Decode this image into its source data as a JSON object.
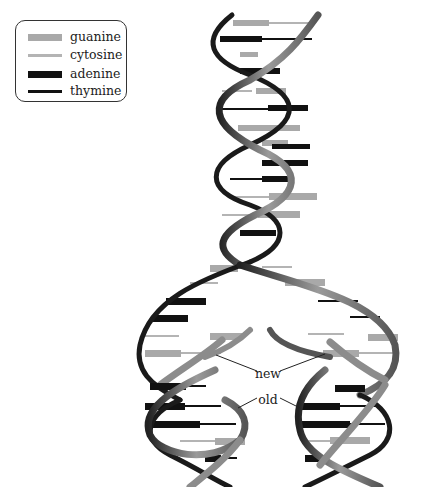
{
  "legend": {
    "items": [
      {
        "label": "guanine",
        "color": "#a9a9a9",
        "thickness": 7
      },
      {
        "label": "cytosine",
        "color": "#b4b4b4",
        "thickness": 3
      },
      {
        "label": "adenine",
        "color": "#111111",
        "thickness": 7
      },
      {
        "label": "thymine",
        "color": "#111111",
        "thickness": 3
      }
    ]
  },
  "labels": {
    "new": "new",
    "old": "old"
  },
  "colors": {
    "backbone_dark": "#1a1a1a",
    "backbone_light": "#8c8c8c",
    "background": "#ffffff"
  },
  "diagram": {
    "regions": [
      "parent-helix",
      "replication-fork",
      "daughter-helix-left",
      "daughter-helix-right"
    ]
  }
}
